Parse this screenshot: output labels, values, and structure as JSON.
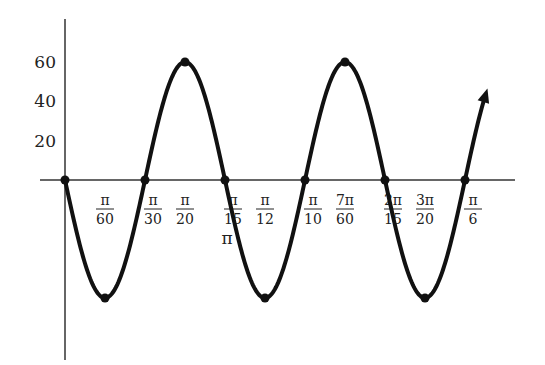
{
  "chart_data": {
    "type": "line",
    "title": "",
    "xlabel": "",
    "ylabel": "",
    "function_hint": "y = -60 sin(30x)",
    "amplitude": 60,
    "period": "π/15",
    "xlim": [
      "0",
      "π/6"
    ],
    "ylim": [
      -65,
      80
    ],
    "grid": false,
    "legend": null,
    "y_ticks": [
      {
        "value": 20,
        "label": "20"
      },
      {
        "value": 40,
        "label": "40"
      },
      {
        "value": 60,
        "label": "60"
      }
    ],
    "x_ticks": [
      {
        "value": "π/60",
        "num": "π",
        "den": "60"
      },
      {
        "value": "π/30",
        "num": "π",
        "den": "30"
      },
      {
        "value": "π/20",
        "num": "π",
        "den": "20"
      },
      {
        "value": "π/15",
        "num": "π",
        "den": "15"
      },
      {
        "value": "π/12",
        "num": "π",
        "den": "12"
      },
      {
        "value": "π/10",
        "num": "π",
        "den": "10"
      },
      {
        "value": "7π/60",
        "num": "7π",
        "den": "60"
      },
      {
        "value": "2π/15",
        "num": "2π",
        "den": "15"
      },
      {
        "value": "3π/20",
        "num": "3π",
        "den": "20"
      },
      {
        "value": "π/6",
        "num": "π",
        "den": "6"
      }
    ],
    "extra_label": "π",
    "points": [
      {
        "x": "0",
        "y": 0
      },
      {
        "x": "π/60",
        "y": -60
      },
      {
        "x": "π/30",
        "y": 0
      },
      {
        "x": "π/20",
        "y": 60
      },
      {
        "x": "π/15",
        "y": 0
      },
      {
        "x": "π/12",
        "y": -60
      },
      {
        "x": "π/10",
        "y": 0
      },
      {
        "x": "7π/60",
        "y": 60
      },
      {
        "x": "2π/15",
        "y": 0
      },
      {
        "x": "3π/20",
        "y": -60
      },
      {
        "x": "π/6",
        "y": 0
      }
    ],
    "continues_arrow": true
  }
}
